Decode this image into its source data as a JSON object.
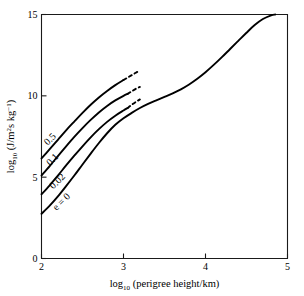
{
  "chart_data": {
    "type": "line",
    "title": "",
    "xlabel": "log10 (perigree height/km)",
    "ylabel": "log10 (J/m2s kg-1)",
    "xlabel_parts": {
      "prefix": "log",
      "subscript": "10",
      "suffix": " (perigree height/km)"
    },
    "ylabel_parts": {
      "prefix": "log",
      "subscript": "10",
      "mid": " (J/m",
      "sup1": "2",
      "mid2": "s kg",
      "sup2": "−1",
      "suffix": ")"
    },
    "xlim": [
      2,
      5
    ],
    "ylim": [
      0,
      15
    ],
    "xticks": [
      2,
      3,
      4,
      5
    ],
    "xtick_labels": [
      "2",
      "3",
      "4",
      "5"
    ],
    "yticks": [
      0,
      5,
      10,
      15
    ],
    "ytick_labels": [
      "0",
      "5",
      "10",
      "15"
    ],
    "grid": false,
    "legend_position": "inline-curve-labels",
    "series": [
      {
        "name": "0.5",
        "label": "0.5",
        "label_rotation": -45,
        "label_x": 2.13,
        "label_y": 7.2,
        "solid_points": [
          [
            2.0,
            6.15
          ],
          [
            2.1,
            6.72
          ],
          [
            2.2,
            7.3
          ],
          [
            2.3,
            7.88
          ],
          [
            2.4,
            8.42
          ],
          [
            2.5,
            8.95
          ],
          [
            2.6,
            9.45
          ],
          [
            2.7,
            9.9
          ],
          [
            2.8,
            10.3
          ],
          [
            2.9,
            10.66
          ],
          [
            3.0,
            10.97
          ]
        ],
        "dashed_points": [
          [
            3.0,
            10.97
          ],
          [
            3.05,
            11.12
          ],
          [
            3.1,
            11.27
          ],
          [
            3.15,
            11.42
          ],
          [
            3.2,
            11.55
          ]
        ]
      },
      {
        "name": "0.1",
        "label": "0.1",
        "label_rotation": -45,
        "label_x": 2.16,
        "label_y": 5.95,
        "solid_points": [
          [
            2.0,
            5.1
          ],
          [
            2.1,
            5.68
          ],
          [
            2.2,
            6.3
          ],
          [
            2.3,
            6.9
          ],
          [
            2.4,
            7.48
          ],
          [
            2.5,
            8.02
          ],
          [
            2.6,
            8.52
          ],
          [
            2.7,
            8.98
          ],
          [
            2.8,
            9.38
          ],
          [
            2.9,
            9.72
          ],
          [
            3.0,
            10.0
          ],
          [
            3.05,
            10.12
          ]
        ],
        "dashed_points": [
          [
            3.05,
            10.12
          ],
          [
            3.1,
            10.28
          ],
          [
            3.15,
            10.43
          ],
          [
            3.2,
            10.55
          ]
        ]
      },
      {
        "name": "0.02",
        "label": "0.02",
        "label_rotation": -45,
        "label_x": 2.22,
        "label_y": 4.62,
        "solid_points": [
          [
            2.0,
            3.95
          ],
          [
            2.1,
            4.5
          ],
          [
            2.2,
            5.1
          ],
          [
            2.3,
            5.72
          ],
          [
            2.4,
            6.32
          ],
          [
            2.5,
            6.9
          ],
          [
            2.6,
            7.45
          ],
          [
            2.7,
            7.95
          ],
          [
            2.8,
            8.4
          ],
          [
            2.9,
            8.78
          ],
          [
            3.0,
            9.1
          ],
          [
            3.05,
            9.25
          ]
        ],
        "dashed_points": [
          [
            3.05,
            9.25
          ],
          [
            3.1,
            9.45
          ],
          [
            3.15,
            9.62
          ],
          [
            3.2,
            9.78
          ]
        ]
      },
      {
        "name": "e = 0",
        "label": "e = 0",
        "label_rotation": -45,
        "label_x": 2.27,
        "label_y": 3.35,
        "solid_points": [
          [
            2.0,
            2.75
          ],
          [
            2.1,
            3.25
          ],
          [
            2.2,
            3.82
          ],
          [
            2.3,
            4.45
          ],
          [
            2.4,
            5.1
          ],
          [
            2.5,
            5.78
          ],
          [
            2.6,
            6.45
          ],
          [
            2.7,
            7.1
          ],
          [
            2.8,
            7.7
          ],
          [
            2.9,
            8.22
          ],
          [
            3.0,
            8.62
          ],
          [
            3.1,
            8.95
          ],
          [
            3.2,
            9.25
          ],
          [
            3.3,
            9.5
          ],
          [
            3.4,
            9.72
          ],
          [
            3.5,
            9.93
          ],
          [
            3.6,
            10.15
          ],
          [
            3.7,
            10.4
          ],
          [
            3.8,
            10.7
          ],
          [
            3.9,
            11.05
          ],
          [
            4.0,
            11.45
          ],
          [
            4.1,
            11.9
          ],
          [
            4.2,
            12.38
          ],
          [
            4.3,
            12.88
          ],
          [
            4.4,
            13.38
          ],
          [
            4.5,
            13.88
          ],
          [
            4.6,
            14.35
          ],
          [
            4.7,
            14.72
          ],
          [
            4.8,
            14.95
          ],
          [
            4.85,
            15.0
          ]
        ],
        "dashed_points": []
      }
    ]
  }
}
